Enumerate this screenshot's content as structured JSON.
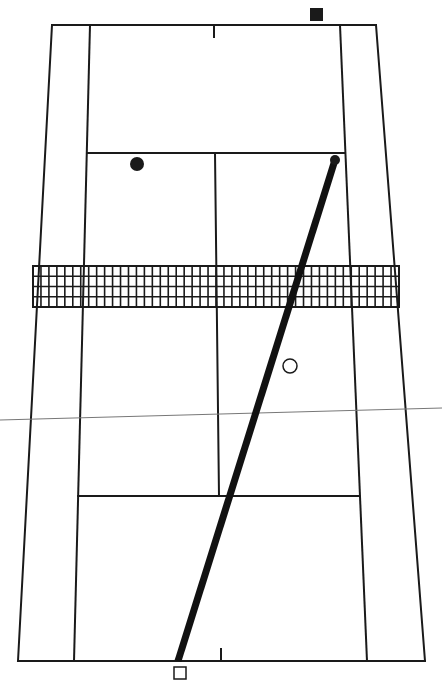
{
  "diagram": {
    "type": "tennis-court-shot-diagram",
    "colors": {
      "background": "#ffffff",
      "lines": "#1a1a1a",
      "net": "#1a1a1a",
      "shot_path": "#111111",
      "reference_line": "#777777"
    },
    "court": {
      "top_baseline": {
        "x1": 52,
        "y1": 25,
        "x2": 376,
        "y2": 25
      },
      "bottom_baseline": {
        "x1": 18,
        "y1": 661,
        "x2": 425,
        "y2": 661
      },
      "left_doubles_sideline": {
        "x1": 52,
        "y1": 25,
        "x2": 18,
        "y2": 661
      },
      "right_doubles_sideline": {
        "x1": 376,
        "y1": 25,
        "x2": 425,
        "y2": 661
      },
      "left_singles_sideline": {
        "x1": 90,
        "y1": 25,
        "x2": 74,
        "y2": 661
      },
      "right_singles_sideline": {
        "x1": 340,
        "y1": 25,
        "x2": 367,
        "y2": 661
      },
      "top_service_line": {
        "x1": 87,
        "y1": 153,
        "x2": 345,
        "y2": 153
      },
      "bottom_service_line": {
        "x1": 78,
        "y1": 496,
        "x2": 359,
        "y2": 496
      },
      "center_service_line": {
        "x1": 215,
        "y1": 153,
        "x2": 219,
        "y2": 496
      },
      "top_center_mark": {
        "x1": 214,
        "y1": 25,
        "x2": 214,
        "y2": 37
      },
      "bottom_center_mark": {
        "x1": 221,
        "y1": 649,
        "x2": 221,
        "y2": 661
      }
    },
    "net": {
      "x": 33,
      "y": 266,
      "width": 366,
      "height": 41,
      "rows": 4,
      "cols": 46
    },
    "shot_path": {
      "x1": 335,
      "y1": 160,
      "x2": 178,
      "y2": 661,
      "width": 7
    },
    "reference_line": {
      "x1": 0,
      "y1": 420,
      "x2": 442,
      "y2": 408
    },
    "markers": [
      {
        "name": "opponent-player",
        "shape": "filled-square",
        "x": 310,
        "y": 8,
        "size": 13
      },
      {
        "name": "opponent-partner",
        "shape": "filled-circle",
        "cx": 137,
        "cy": 164,
        "r": 7
      },
      {
        "name": "ball-contact",
        "shape": "filled-circle",
        "cx": 335,
        "cy": 160,
        "r": 5
      },
      {
        "name": "partner-position",
        "shape": "hollow-circle",
        "cx": 290,
        "cy": 366,
        "r": 7
      },
      {
        "name": "server-position",
        "shape": "hollow-square",
        "x": 174,
        "y": 667,
        "size": 12
      }
    ]
  }
}
